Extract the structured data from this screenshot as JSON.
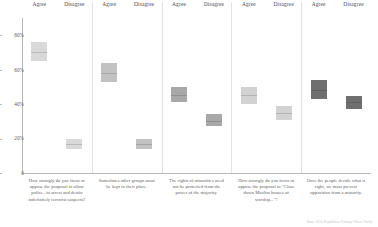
{
  "axis": {
    "y_ticks": [
      "0",
      "20%",
      "40%",
      "60%",
      "80%"
    ],
    "y_values": [
      0,
      20,
      40,
      60,
      80
    ],
    "ylim": [
      0,
      90
    ]
  },
  "columns": {
    "agree_label": "Agree",
    "disagree_label": "Disagree"
  },
  "source_note": "Data: 2016 Republican Primary Voters Study",
  "chart_data": {
    "type": "bar",
    "title": "",
    "subtitle": "",
    "xlabel": "",
    "ylabel": "",
    "ylim": [
      0,
      90
    ],
    "grid": false,
    "legend_position": "top",
    "categories": [
      "Agree",
      "Disagree"
    ],
    "panel_layout": "1 row x 5 columns, shared y axis, faceted by question",
    "note": "Each block is a shaded interval (uncertainty band) with a darker median line; shading darkens left to right across panels.",
    "panels": [
      {
        "index": 1,
        "question": "How strongly do you favor or oppose the proposal to allow police...to arrest and detain indefinitely terrorist suspects?",
        "color": "#d9d9d9",
        "bars": [
          {
            "category": "Agree",
            "value": 70,
            "low": 65,
            "high": 76
          },
          {
            "category": "Disagree",
            "value": 17,
            "low": 14,
            "high": 20
          }
        ]
      },
      {
        "index": 2,
        "question": "Sometimes other groups must be kept in their place.",
        "color": "#c2c2c2",
        "bars": [
          {
            "category": "Agree",
            "value": 58,
            "low": 53,
            "high": 64
          },
          {
            "category": "Disagree",
            "value": 17,
            "low": 14,
            "high": 20
          }
        ]
      },
      {
        "index": 3,
        "question": "The rights of minorities need not be protected from the power of the majority.",
        "color": "#a8a8a8",
        "bars": [
          {
            "category": "Agree",
            "value": 45,
            "low": 41,
            "high": 50
          },
          {
            "category": "Disagree",
            "value": 30,
            "low": 27,
            "high": 34
          }
        ]
      },
      {
        "index": 4,
        "question": "How strongly do you favor or oppose the proposal to \"Close down Muslim houses of worship...\"?",
        "color": "#d2d2d2",
        "bars": [
          {
            "category": "Agree",
            "value": 45,
            "low": 40,
            "high": 50
          },
          {
            "category": "Disagree",
            "value": 35,
            "low": 31,
            "high": 39
          }
        ]
      },
      {
        "index": 5,
        "question": "Once the people decide what is right, we must prevent opposition from a minority.",
        "color": "#6f6f6f",
        "bars": [
          {
            "category": "Agree",
            "value": 48,
            "low": 43,
            "high": 54
          },
          {
            "category": "Disagree",
            "value": 41,
            "low": 37,
            "high": 45
          }
        ]
      }
    ]
  }
}
